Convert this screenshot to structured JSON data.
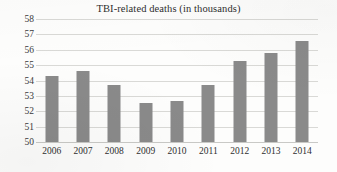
{
  "chart_data": {
    "type": "bar",
    "title": "TBI-related deaths (in thousands)",
    "xlabel": "",
    "ylabel": "",
    "categories": [
      "2006",
      "2007",
      "2008",
      "2009",
      "2010",
      "2011",
      "2012",
      "2013",
      "2014"
    ],
    "values": [
      54.3,
      54.6,
      53.7,
      52.55,
      52.7,
      53.7,
      55.25,
      55.8,
      56.6
    ],
    "ylim": [
      50,
      58
    ],
    "ytick_step": 1,
    "ytick_labels": [
      "58",
      "57",
      "56",
      "55",
      "54",
      "53",
      "52",
      "51",
      "50"
    ],
    "grid": true,
    "legend": false,
    "legend_position": "none",
    "bar_color": "#8a8a8a",
    "gridline_color": "#d9d9d6",
    "background_color": "#fdfdfc"
  }
}
